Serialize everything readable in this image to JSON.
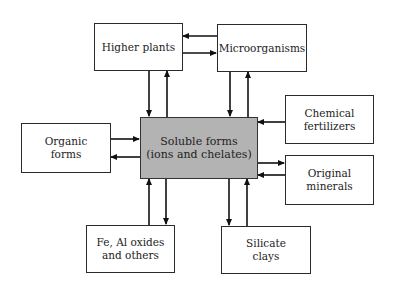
{
  "diagram": {
    "title": "",
    "nodes": [
      {
        "id": "higher-plants",
        "label": "Higher plants"
      },
      {
        "id": "microorganisms",
        "label": "Microorganisms"
      },
      {
        "id": "chemical-fertilizers",
        "label_line1": "Chemical",
        "label_line2": "fertilizers"
      },
      {
        "id": "organic-forms",
        "label_line1": "Organic",
        "label_line2": "forms"
      },
      {
        "id": "soluble-forms",
        "label_line1": "Soluble forms",
        "label_line2": "(ions and chelates)"
      },
      {
        "id": "original-minerals",
        "label_line1": "Original",
        "label_line2": "minerals"
      },
      {
        "id": "fe-al-oxides",
        "label_line1": "Fe, Al oxides",
        "label_line2": "and others"
      },
      {
        "id": "silicate-clays",
        "label_line1": "Silicate",
        "label_line2": "clays"
      }
    ],
    "edges": [
      {
        "from": "microorganisms",
        "to": "higher-plants"
      },
      {
        "from": "higher-plants",
        "to": "microorganisms"
      },
      {
        "from": "higher-plants",
        "to": "soluble-forms"
      },
      {
        "from": "soluble-forms",
        "to": "higher-plants"
      },
      {
        "from": "microorganisms",
        "to": "soluble-forms"
      },
      {
        "from": "soluble-forms",
        "to": "microorganisms"
      },
      {
        "from": "chemical-fertilizers",
        "to": "soluble-forms"
      },
      {
        "from": "organic-forms",
        "to": "soluble-forms"
      },
      {
        "from": "soluble-forms",
        "to": "organic-forms"
      },
      {
        "from": "soluble-forms",
        "to": "original-minerals"
      },
      {
        "from": "original-minerals",
        "to": "soluble-forms"
      },
      {
        "from": "fe-al-oxides",
        "to": "soluble-forms"
      },
      {
        "from": "soluble-forms",
        "to": "fe-al-oxides"
      },
      {
        "from": "soluble-forms",
        "to": "silicate-clays"
      },
      {
        "from": "silicate-clays",
        "to": "soluble-forms"
      }
    ]
  }
}
